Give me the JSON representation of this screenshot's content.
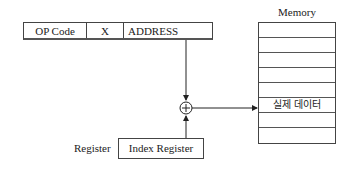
{
  "instruction": {
    "fields": [
      {
        "label": "OP Code"
      },
      {
        "label": "X"
      },
      {
        "label": "ADDRESS"
      }
    ]
  },
  "memory": {
    "title": "Memory",
    "rows": [
      "",
      "",
      "",
      "",
      "",
      "실제 데이터",
      "",
      ""
    ],
    "highlight_index": 5
  },
  "adder": {
    "symbol": "+"
  },
  "index_register": {
    "box_label": "Index Register",
    "side_label": "Register"
  }
}
